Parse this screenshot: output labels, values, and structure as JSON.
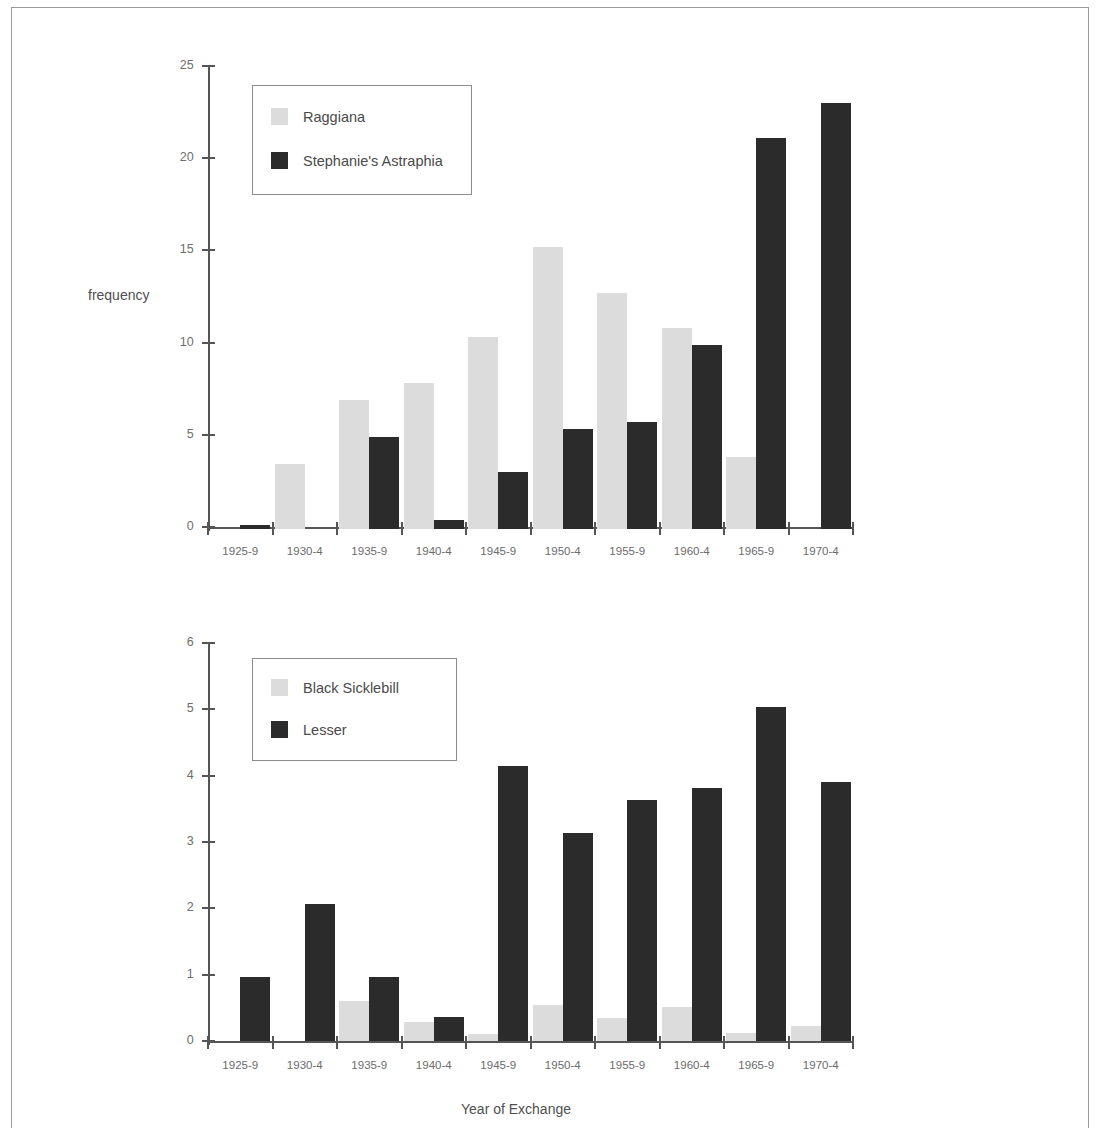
{
  "figure": {
    "xlabel": "Year of Exchange",
    "ylabel_top": "frequency"
  },
  "chart_data": [
    {
      "type": "bar",
      "id": "top",
      "title": "",
      "xlabel": "",
      "ylabel": "frequency",
      "ylim": [
        0,
        25
      ],
      "yticks": [
        0,
        5,
        10,
        15,
        20,
        25
      ],
      "grid": false,
      "legend_position": "upper-left",
      "categories": [
        "1925-9",
        "1930-4",
        "1935-9",
        "1940-4",
        "1945-9",
        "1950-4",
        "1955-9",
        "1960-4",
        "1965-9",
        "1970-4"
      ],
      "series": [
        {
          "name": "Raggiana",
          "color": "#dcdcdc",
          "values": [
            0,
            3.5,
            7.0,
            7.9,
            10.4,
            15.3,
            12.8,
            10.9,
            3.9,
            0
          ]
        },
        {
          "name": "Stephanie's Astraphia",
          "color": "#2b2b2b",
          "values": [
            0.2,
            0,
            5.0,
            0.5,
            3.1,
            5.4,
            5.8,
            10.0,
            21.2,
            23.1
          ]
        }
      ]
    },
    {
      "type": "bar",
      "id": "bottom",
      "title": "",
      "xlabel": "Year of Exchange",
      "ylabel": "",
      "ylim": [
        0,
        6
      ],
      "yticks": [
        0,
        1,
        2,
        3,
        4,
        5,
        6
      ],
      "grid": false,
      "legend_position": "upper-left",
      "categories": [
        "1925-9",
        "1930-4",
        "1935-9",
        "1940-4",
        "1945-9",
        "1950-4",
        "1955-9",
        "1960-4",
        "1965-9",
        "1970-4"
      ],
      "series": [
        {
          "name": "Black Sicklebill",
          "color": "#dcdcdc",
          "values": [
            0,
            0,
            0.6,
            0.28,
            0.1,
            0.55,
            0.35,
            0.52,
            0.12,
            0.23
          ]
        },
        {
          "name": "Lesser",
          "color": "#2b2b2b",
          "values": [
            0.97,
            2.07,
            0.96,
            0.36,
            4.15,
            3.14,
            3.63,
            3.82,
            5.03,
            3.9
          ]
        }
      ]
    }
  ],
  "top_legend": {
    "entries": [
      {
        "label": "Raggiana",
        "swatch": "light"
      },
      {
        "label": "Stephanie's Astraphia",
        "swatch": "dark"
      }
    ]
  },
  "bottom_legend": {
    "entries": [
      {
        "label": "Black Sicklebill",
        "swatch": "light"
      },
      {
        "label": "Lesser",
        "swatch": "dark"
      }
    ]
  }
}
